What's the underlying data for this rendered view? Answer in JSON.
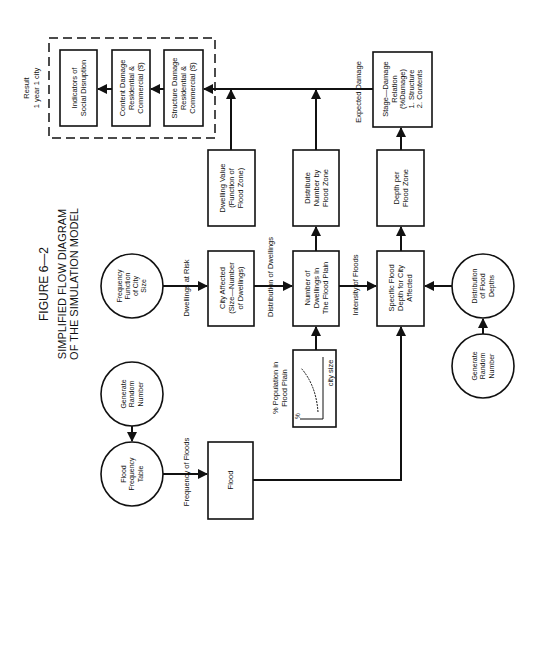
{
  "figure": {
    "number": "FIGURE 6—2",
    "title_line1": "SIMPLIFIED FLOW DIAGRAM",
    "title_line2": "OF THE SIMULATION MODEL"
  },
  "result": {
    "label_line1": "Result",
    "label_line2": "1 year    1 city",
    "boxes": [
      {
        "lines": [
          "Indicators of",
          "Social Disruption"
        ]
      },
      {
        "lines": [
          "Content Damage",
          "Residential &",
          "Commercial ($)"
        ]
      },
      {
        "lines": [
          "Structure Damage",
          "Residential &",
          "Commercial ($)"
        ]
      }
    ]
  },
  "nodes": {
    "stage_damage": [
      "Stage—Damage",
      "Relation",
      "(%Damage)",
      "1. Structure",
      "2. Contents"
    ],
    "dwelling_value": [
      "Dwelling Value",
      "(Function of",
      "Flood Zone)"
    ],
    "distribute_number": [
      "Distribute",
      "Number by",
      "Flood Zone"
    ],
    "depth_per_zone": [
      "Depth per",
      "Flood Zone"
    ],
    "frequency_city_size": [
      "Frequency",
      "Function",
      "of City",
      "Size"
    ],
    "city_affected": [
      "City Affected",
      "(Size—Number",
      "of Dwellings)"
    ],
    "number_dwellings": [
      "Number of",
      "Dwellings In",
      "The Flood Plain"
    ],
    "specific_depth": [
      "Specific Flood",
      "Depth for City",
      "Affected"
    ],
    "distribution_depths": [
      "Distribution",
      "of Flood",
      "Depths"
    ],
    "random_right": [
      "Generate",
      "Random",
      "Number"
    ],
    "random_left": [
      "Generate",
      "Random",
      "Number"
    ],
    "flood_freq_table": [
      "Flood",
      "Frequency",
      "Table"
    ],
    "flood": [
      "Flood"
    ],
    "pop_inset": {
      "title": [
        "% Population in",
        "Flood Plain"
      ],
      "x_axis": "city size",
      "y_axis": "%"
    }
  },
  "edge_labels": {
    "expected_damage": "Expected Damage",
    "dwellings_at_risk": "Dwellings at Risk",
    "distribution_of_dwellings": "Distribution of Dwellings",
    "intensity_of_floods": "Intensity of Floods",
    "frequency_of_floods": "Frequency of Floods"
  }
}
